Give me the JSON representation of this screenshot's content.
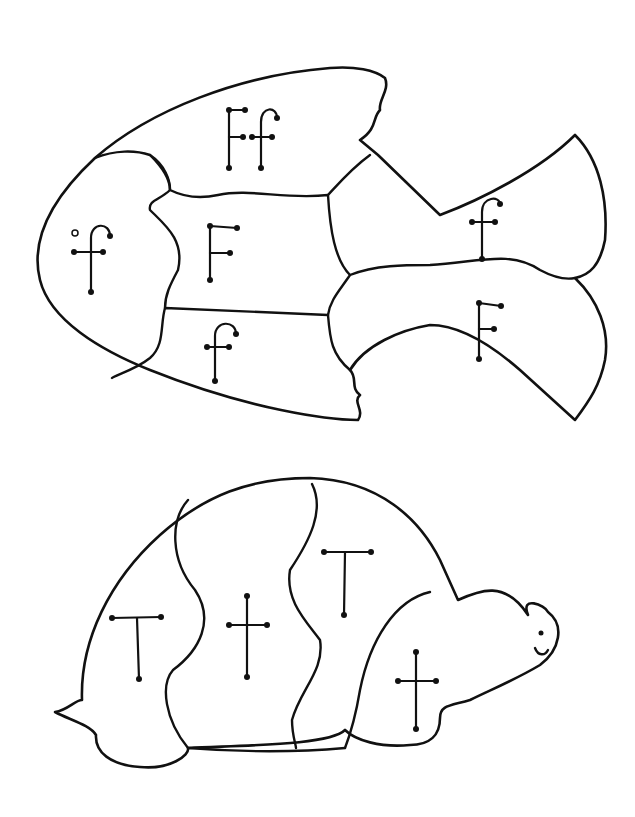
{
  "worksheet": {
    "type": "letter puzzle coloring page",
    "colors": {
      "line": "#111111",
      "background": "#ffffff"
    },
    "fish_puzzle": {
      "letter": "F",
      "pieces": [
        {
          "id": "top-fin",
          "label": "Ff"
        },
        {
          "id": "head",
          "label": "f"
        },
        {
          "id": "middle-body",
          "label": "F"
        },
        {
          "id": "lower-body",
          "label": "f"
        },
        {
          "id": "upper-tail",
          "label": "f"
        },
        {
          "id": "lower-tail",
          "label": "F"
        }
      ]
    },
    "turtle_puzzle": {
      "letter": "T",
      "pieces": [
        {
          "id": "shell-left",
          "label": "T"
        },
        {
          "id": "shell-middle",
          "label": "t"
        },
        {
          "id": "shell-right",
          "label": "T"
        },
        {
          "id": "head-front",
          "label": "t"
        }
      ]
    }
  }
}
